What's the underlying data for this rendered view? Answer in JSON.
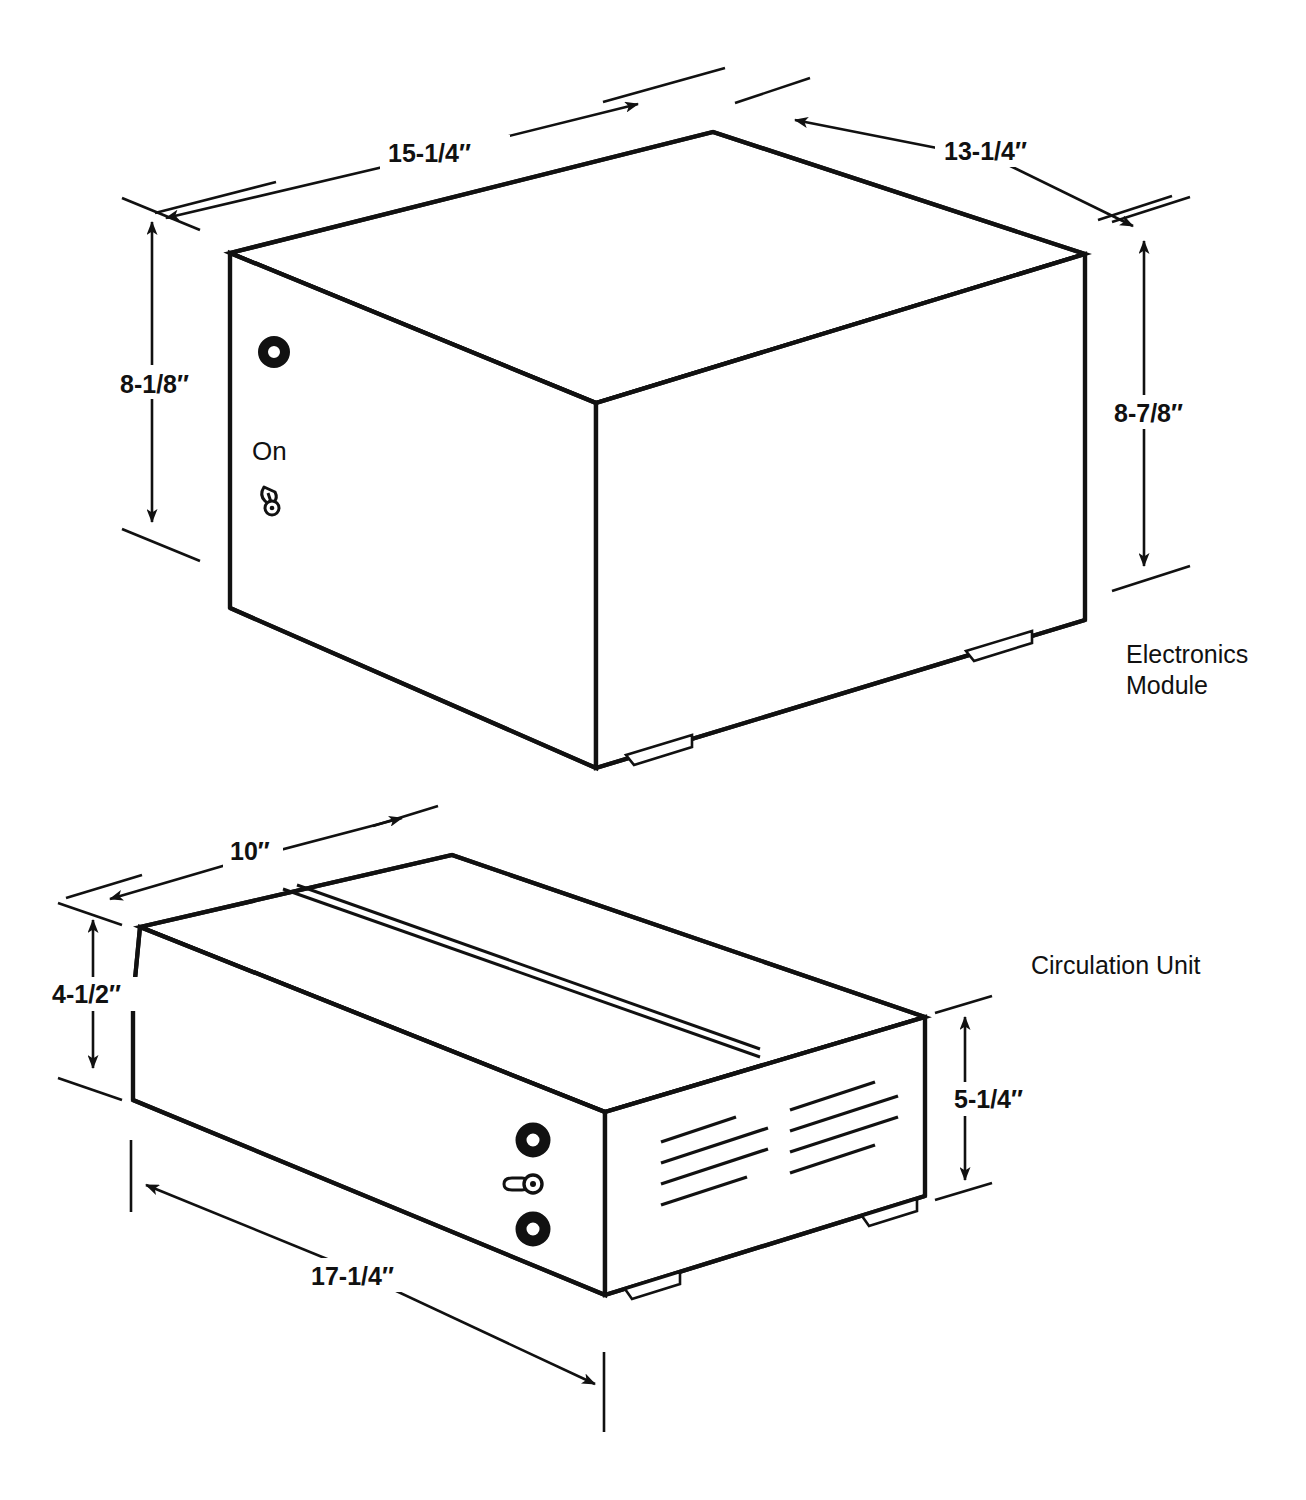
{
  "sheet": {
    "background_color": "#ffffff",
    "ink_color": "#111111",
    "width": 1306,
    "height": 1500
  },
  "units": [
    {
      "id": "electronics-module",
      "name_label": "Electronics\nModule",
      "name_label_line1": "Electronics",
      "name_label_line2": "Module",
      "controls": {
        "indicator_label": "",
        "switch_label": "On"
      },
      "dimensions": [
        {
          "id": "em-width",
          "value": "15-1/4″",
          "axis": "width",
          "描述": "top front-left edge"
        },
        {
          "id": "em-depth",
          "value": "13-1/4″",
          "axis": "depth",
          "描述": "top back-right edge"
        },
        {
          "id": "em-height-left",
          "value": "8-1/8″",
          "axis": "height"
        },
        {
          "id": "em-height-right",
          "value": "8-7/8″",
          "axis": "height"
        }
      ]
    },
    {
      "id": "circulation-unit",
      "name_label": "Circulation Unit",
      "controls": {
        "knob_top": "",
        "switch_middle": "",
        "knob_bottom": ""
      },
      "dimensions": [
        {
          "id": "cu-depth",
          "value": "10″",
          "axis": "depth"
        },
        {
          "id": "cu-height-left",
          "value": "4-1/2″",
          "axis": "height"
        },
        {
          "id": "cu-height-right",
          "value": "5-1/4″",
          "axis": "height"
        },
        {
          "id": "cu-width",
          "value": "17-1/4″",
          "axis": "width"
        }
      ]
    }
  ],
  "labels": {
    "em_width": "15-1/4″",
    "em_depth": "13-1/4″",
    "em_height_left": "8-1/8″",
    "em_height_right": "8-7/8″",
    "em_name_line1": "Electronics",
    "em_name_line2": "Module",
    "em_switch": "On",
    "cu_depth": "10″",
    "cu_height_left": "4-1/2″",
    "cu_height_right": "5-1/4″",
    "cu_width": "17-1/4″",
    "cu_name": "Circulation Unit"
  },
  "icons": {
    "indicator_lamp": "ring-icon",
    "toggle_switch": "toggle-switch-icon",
    "vent_slots": "vent-slots-icon",
    "arrow": "arrow-head-icon"
  }
}
